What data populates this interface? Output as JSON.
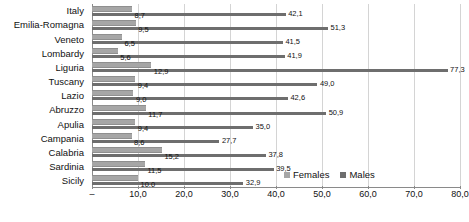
{
  "chart_data": {
    "type": "bar",
    "orientation": "horizontal",
    "title": "",
    "subtitle": "",
    "xlabel": "",
    "ylabel": "",
    "xlim": [
      0,
      80
    ],
    "xticks": [
      0,
      10,
      20,
      30,
      40,
      50,
      60,
      70,
      80
    ],
    "xtick_labels": [
      "–",
      "10,0",
      "20,0",
      "30,0",
      "40,0",
      "50,0",
      "60,0",
      "70,0",
      "80,0"
    ],
    "grid": true,
    "grid_axis": "x",
    "legend_position": "bottom-right",
    "decimal_separator": ",",
    "categories": [
      "Italy",
      "Emilia-Romagna",
      "Veneto",
      "Lombardy",
      "Liguria",
      "Tuscany",
      "Lazio",
      "Abruzzo",
      "Apulia",
      "Campania",
      "Calabria",
      "Sardinia",
      "Sicily"
    ],
    "series": [
      {
        "name": "Females",
        "color": "#a6a6a6",
        "values": [
          8.7,
          9.5,
          6.5,
          5.6,
          12.9,
          9.4,
          9.0,
          11.7,
          9.4,
          8.6,
          15.2,
          11.5,
          10.0
        ],
        "labels": [
          "8,7",
          "9,5",
          "6,5",
          "5,6",
          "12,9",
          "9,4",
          "9,0",
          "11,7",
          "9,4",
          "8,6",
          "15,2",
          "11,5",
          "10,0"
        ]
      },
      {
        "name": "Males",
        "color": "#6e6e6e",
        "values": [
          42.1,
          51.3,
          41.5,
          41.9,
          77.3,
          49.0,
          42.6,
          50.9,
          35.0,
          27.7,
          37.8,
          39.5,
          32.9
        ],
        "labels": [
          "42,1",
          "51,3",
          "41,5",
          "41,9",
          "77,3",
          "49,0",
          "42,6",
          "50,9",
          "35,0",
          "27,7",
          "37,8",
          "39,5",
          "32,9"
        ]
      }
    ]
  },
  "legend": {
    "items": [
      {
        "label": "Females",
        "color": "#a6a6a6"
      },
      {
        "label": "Males",
        "color": "#6e6e6e"
      }
    ]
  },
  "colors": {
    "females": "#a6a6a6",
    "males": "#6e6e6e",
    "gridline": "#d4d4d4",
    "axis": "#8a8a8a",
    "text": "#111111",
    "background": "#ffffff"
  }
}
